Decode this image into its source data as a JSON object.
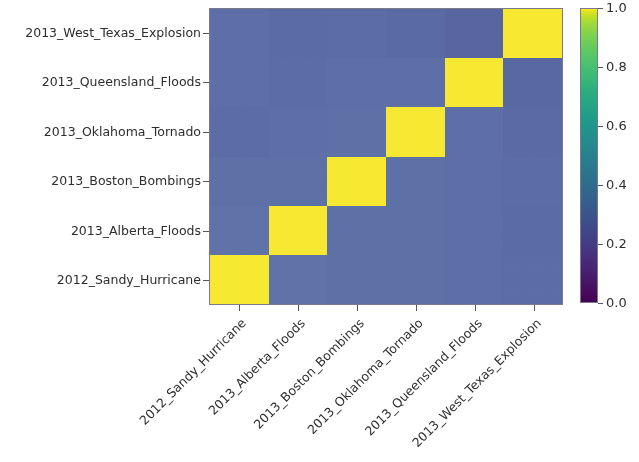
{
  "figure": {
    "background_color": "#ffffff",
    "axes_edge_color": "#7a7a8c"
  },
  "chart_data": {
    "type": "heatmap",
    "title": "",
    "xlabel": "",
    "ylabel": "",
    "colormap": "viridis",
    "colorbar": {
      "vmin": 0.0,
      "vmax": 1.0,
      "ticks": [
        1.0,
        0.8,
        0.6,
        0.4,
        0.2,
        0.0
      ],
      "tick_labels": [
        "1.0",
        "0.8",
        "0.6",
        "0.4",
        "0.2",
        "0.0"
      ],
      "position": "right",
      "orientation": "vertical"
    },
    "grid": false,
    "x_categories": [
      "2012_Sandy_Hurricane",
      "2013_Alberta_Floods",
      "2013_Boston_Bombings",
      "2013_Oklahoma_Tornado",
      "2013_Queensland_Floods",
      "2013_West_Texas_Explosion"
    ],
    "y_categories": [
      "2012_Sandy_Hurricane",
      "2013_Alberta_Floods",
      "2013_Boston_Bombings",
      "2013_Oklahoma_Tornado",
      "2013_Queensland_Floods",
      "2013_West_Texas_Explosion"
    ],
    "y_categories_top_to_bottom": [
      "2013_West_Texas_Explosion",
      "2013_Queensland_Floods",
      "2013_Oklahoma_Tornado",
      "2013_Boston_Bombings",
      "2013_Alberta_Floods",
      "2012_Sandy_Hurricane"
    ],
    "x_tick_rotation_deg": -45,
    "values_top_to_bottom": [
      [
        0.4,
        0.38,
        0.39,
        0.37,
        0.35,
        1.0
      ],
      [
        0.4,
        0.39,
        0.4,
        0.4,
        1.0,
        0.36
      ],
      [
        0.39,
        0.4,
        0.41,
        1.0,
        0.4,
        0.37
      ],
      [
        0.41,
        0.41,
        1.0,
        0.41,
        0.4,
        0.39
      ],
      [
        0.42,
        1.0,
        0.41,
        0.41,
        0.4,
        0.38
      ],
      [
        1.0,
        0.42,
        0.41,
        0.41,
        0.4,
        0.39
      ]
    ],
    "cell_colors_top_to_bottom": [
      [
        "#5d6fa6",
        "#5b6ca4",
        "#5c6da5",
        "#5a6aa3",
        "#58659f",
        "#f7e832"
      ],
      [
        "#5d6fa6",
        "#5c6da5",
        "#5d6fa6",
        "#5d6fa6",
        "#f7e832",
        "#5a68a1"
      ],
      [
        "#5c6da5",
        "#5d6fa6",
        "#5e71a7",
        "#f7e832",
        "#5d6fa6",
        "#5b6aa3"
      ],
      [
        "#5e71a7",
        "#5e71a7",
        "#f7e832",
        "#5e71a7",
        "#5d6fa6",
        "#5c6da5"
      ],
      [
        "#5f73a8",
        "#f7e832",
        "#5e71a7",
        "#5e71a7",
        "#5d6fa6",
        "#5b6ca4"
      ],
      [
        "#f7e832",
        "#5f73a8",
        "#5e71a7",
        "#5e71a7",
        "#5d6fa6",
        "#5c6da5"
      ]
    ],
    "diagonal_value": 1.0,
    "diagonal_color": "#f7e832",
    "offdiagonal_color_approx": "#5d6fa6",
    "n_rows": 6,
    "n_cols": 6,
    "matrix_symmetric": true
  }
}
